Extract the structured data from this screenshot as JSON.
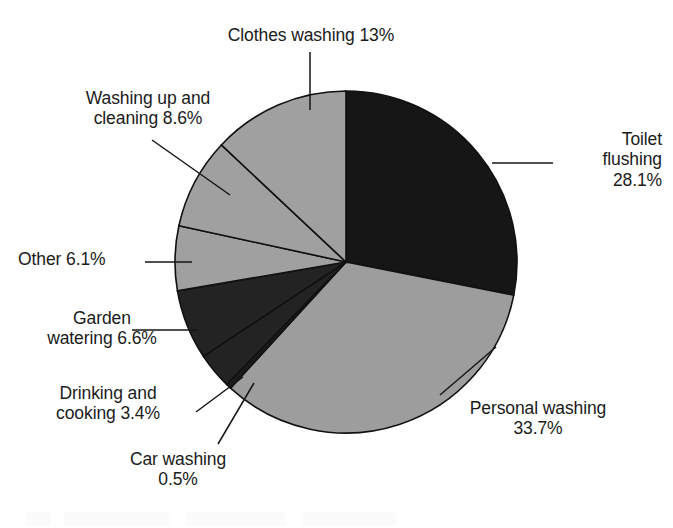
{
  "chart_data": {
    "type": "pie",
    "title": "",
    "subtitle": "",
    "xlabel": "",
    "ylabel": "",
    "legend_position": "none",
    "grid": false,
    "units": "percent",
    "start_angle_deg": 0,
    "direction": "clockwise",
    "total": 100.0,
    "categories": [
      "Toilet flushing",
      "Personal washing",
      "Car washing",
      "Drinking and cooking",
      "Garden watering",
      "Other",
      "Washing up and cleaning",
      "Clothes washing"
    ],
    "values": [
      28.1,
      33.7,
      0.5,
      3.4,
      6.6,
      6.1,
      8.6,
      13.0
    ],
    "slices": [
      {
        "name": "Toilet flushing",
        "value": 28.1,
        "value_text": "28.1%",
        "label_lines": [
          "Toilet",
          "flushing",
          "28.1%"
        ],
        "label_text": "Toilet\nflushing\n28.1%",
        "color": "#161616",
        "leader": true
      },
      {
        "name": "Personal washing",
        "value": 33.7,
        "value_text": "33.7%",
        "label_lines": [
          "Personal washing",
          "33.7%"
        ],
        "label_text": "Personal washing\n33.7%",
        "color": "#9d9d9d",
        "leader": true
      },
      {
        "name": "Car washing",
        "value": 0.5,
        "value_text": "0.5%",
        "label_lines": [
          "Car washing",
          "0.5%"
        ],
        "label_text": "Car washing\n0.5%",
        "color": "#1c1c1c",
        "leader": true
      },
      {
        "name": "Drinking and cooking",
        "value": 3.4,
        "value_text": "3.4%",
        "label_lines": [
          "Drinking and",
          "cooking 3.4%"
        ],
        "label_text": "Drinking and\ncooking 3.4%",
        "color": "#232323",
        "leader": true
      },
      {
        "name": "Garden watering",
        "value": 6.6,
        "value_text": "6.6%",
        "label_lines": [
          "Garden",
          "watering 6.6%"
        ],
        "label_text": "Garden\nwatering 6.6%",
        "color": "#232323",
        "leader": true
      },
      {
        "name": "Other",
        "value": 6.1,
        "value_text": "6.1%",
        "label_lines": [
          "Other 6.1%"
        ],
        "label_text": "Other 6.1%",
        "color": "#a0a0a0",
        "leader": true
      },
      {
        "name": "Washing up and cleaning",
        "value": 8.6,
        "value_text": "8.6%",
        "label_lines": [
          "Washing up and",
          "cleaning 8.6%"
        ],
        "label_text": "Washing up and\ncleaning 8.6%",
        "color": "#a0a0a0",
        "leader": true
      },
      {
        "name": "Clothes washing",
        "value": 13.0,
        "value_text": "13%",
        "label_lines": [
          "Clothes washing 13%"
        ],
        "label_text": "Clothes washing 13%",
        "color": "#a0a0a0",
        "leader": true
      }
    ],
    "colors": {
      "dark": "#161616",
      "mid_dark": "#232323",
      "light_gray": "#a0a0a0",
      "outline": "#111111",
      "background": "#ffffff",
      "text": "#1b1b1b"
    }
  }
}
